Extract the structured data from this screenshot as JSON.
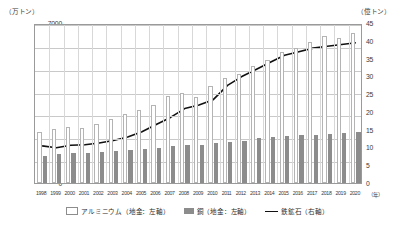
{
  "axis": {
    "left_unit": "（万トン）",
    "right_unit": "（億トン）",
    "x_unit": "（年）"
  },
  "legend": {
    "items": [
      {
        "label": "アルミニウム（地金：左軸）",
        "marker": "bar-outline-swatch",
        "color": "#ffffff"
      },
      {
        "label": "銅（地金：左軸）",
        "marker": "bar-filled-swatch",
        "color": "#8c8c8c"
      },
      {
        "label": "鉄鉱石（右軸）",
        "marker": "line-swatch",
        "color": "#111111"
      }
    ]
  },
  "chart_data": {
    "type": "bar",
    "title": "",
    "subtitle": "",
    "xlabel": "（年）",
    "ylabel": "（万トン）",
    "y2label": "（億トン）",
    "ylim": [
      0,
      7000
    ],
    "y2lim": [
      0,
      45
    ],
    "yticks": [
      0,
      1000,
      2000,
      3000,
      4000,
      5000,
      6000,
      7000
    ],
    "y2ticks": [
      0,
      5,
      10,
      15,
      20,
      25,
      30,
      35,
      40,
      45
    ],
    "grid": true,
    "legend_position": "bottom",
    "categories": [
      "1998",
      "1999",
      "2000",
      "2001",
      "2002",
      "2003",
      "2004",
      "2005",
      "2006",
      "2007",
      "2008",
      "2009",
      "2010",
      "2011",
      "2012",
      "2013",
      "2014",
      "2015",
      "2016",
      "2017",
      "2018",
      "2019",
      "2020"
    ],
    "series": [
      {
        "name": "アルミニウム（地金：左軸）",
        "type": "bar",
        "axis": "left",
        "color": "#ffffff",
        "edge_color": "#b4b4b4",
        "values": [
          2250,
          2350,
          2450,
          2420,
          2600,
          2800,
          3000,
          3200,
          3400,
          3800,
          3950,
          3750,
          4250,
          4600,
          4750,
          5100,
          5400,
          5750,
          5900,
          6150,
          6450,
          6350,
          6550
        ]
      },
      {
        "name": "銅（地金：左軸）",
        "type": "bar",
        "axis": "left",
        "color": "#8c8c8c",
        "values": [
          1200,
          1250,
          1300,
          1320,
          1350,
          1400,
          1450,
          1500,
          1550,
          1600,
          1650,
          1650,
          1750,
          1800,
          1850,
          1950,
          2000,
          2050,
          2100,
          2100,
          2150,
          2200,
          2250
        ]
      },
      {
        "name": "鉄鉱石（右軸）",
        "type": "line",
        "axis": "right",
        "color": "#111111",
        "values": [
          11.0,
          10.5,
          11.2,
          11.3,
          11.8,
          12.5,
          13.5,
          15.0,
          17.0,
          19.0,
          21.5,
          22.5,
          24.0,
          28.0,
          30.5,
          32.5,
          34.5,
          36.5,
          37.5,
          38.5,
          39.0,
          39.5,
          40.0
        ]
      }
    ]
  }
}
